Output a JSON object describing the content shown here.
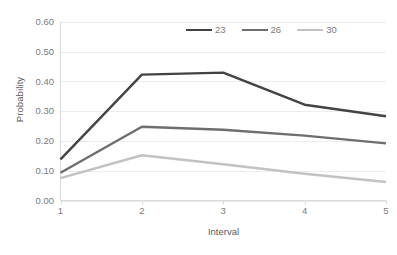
{
  "chart_data": {
    "type": "line",
    "title": "",
    "xlabel": "Interval",
    "ylabel": "Probability",
    "categories": [
      "1",
      "2",
      "3",
      "4",
      "5"
    ],
    "x": [
      1,
      2,
      3,
      4,
      5
    ],
    "xlim": [
      1,
      5
    ],
    "ylim": [
      0.0,
      0.6
    ],
    "ytick_labels": [
      "0.60",
      "0.50",
      "0.40",
      "0.30",
      "0.20",
      "0.10",
      "0.00"
    ],
    "ytick_values": [
      0.6,
      0.5,
      0.4,
      0.3,
      0.2,
      0.1,
      0.0
    ],
    "grid": "horizontal",
    "legend_position": "top-center",
    "series": [
      {
        "name": "23",
        "color": "#434343",
        "values": [
          0.138,
          0.423,
          0.43,
          0.322,
          0.283
        ]
      },
      {
        "name": "26",
        "color": "#6e6e6e",
        "values": [
          0.093,
          0.248,
          0.238,
          0.218,
          0.192
        ]
      },
      {
        "name": "30",
        "color": "#c2c2c2",
        "values": [
          0.075,
          0.152,
          0.122,
          0.09,
          0.062
        ]
      }
    ]
  },
  "axes": {
    "y_title": "Probability",
    "x_title": "Interval"
  },
  "colors": {
    "axis_line": "#d9d9d9",
    "grid_line": "#ededed",
    "tick_text": "#7a7a7a",
    "title_text": "#595959",
    "background": "#ffffff"
  }
}
